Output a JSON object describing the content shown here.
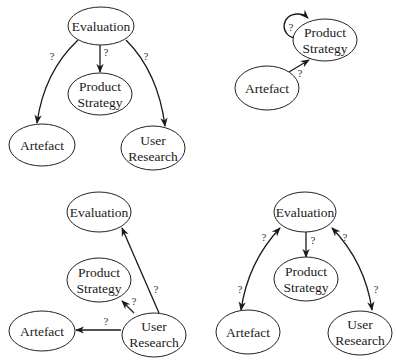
{
  "edge_label": "?",
  "colors": {
    "stroke": "#1a1a1a",
    "text": "#1a1a1a",
    "background": "#ffffff"
  },
  "diagrams": [
    {
      "id": "top-left",
      "nodes": [
        {
          "id": "evaluation",
          "lines": [
            "Evaluation"
          ]
        },
        {
          "id": "product-strategy",
          "lines": [
            "Product",
            "Strategy"
          ]
        },
        {
          "id": "artefact",
          "lines": [
            "Artefact"
          ]
        },
        {
          "id": "user-research",
          "lines": [
            "User",
            "Research"
          ]
        }
      ],
      "edges": [
        {
          "from": "Evaluation",
          "to": "Artefact",
          "label": "?",
          "direction": "forward"
        },
        {
          "from": "Evaluation",
          "to": "Product Strategy",
          "label": "?",
          "direction": "forward"
        },
        {
          "from": "Evaluation",
          "to": "User Research",
          "label": "?",
          "direction": "forward"
        }
      ]
    },
    {
      "id": "top-right",
      "nodes": [
        {
          "id": "product-strategy",
          "lines": [
            "Product",
            "Strategy"
          ]
        },
        {
          "id": "artefact",
          "lines": [
            "Artefact"
          ]
        }
      ],
      "edges": [
        {
          "from": "Product Strategy",
          "to": "Product Strategy",
          "label": "?",
          "direction": "self-loop"
        },
        {
          "from": "Artefact",
          "to": "Product Strategy",
          "label": "?",
          "direction": "forward"
        }
      ]
    },
    {
      "id": "bottom-left",
      "nodes": [
        {
          "id": "evaluation",
          "lines": [
            "Evaluation"
          ]
        },
        {
          "id": "product-strategy",
          "lines": [
            "Product",
            "Strategy"
          ]
        },
        {
          "id": "artefact",
          "lines": [
            "Artefact"
          ]
        },
        {
          "id": "user-research",
          "lines": [
            "User",
            "Research"
          ]
        }
      ],
      "edges": [
        {
          "from": "User Research",
          "to": "Evaluation",
          "label": "?",
          "direction": "forward"
        },
        {
          "from": "User Research",
          "to": "Product Strategy",
          "label": "?",
          "direction": "forward"
        },
        {
          "from": "User Research",
          "to": "Artefact",
          "label": "?",
          "direction": "forward"
        }
      ]
    },
    {
      "id": "bottom-right",
      "nodes": [
        {
          "id": "evaluation",
          "lines": [
            "Evaluation"
          ]
        },
        {
          "id": "product-strategy",
          "lines": [
            "Product",
            "Strategy"
          ]
        },
        {
          "id": "artefact",
          "lines": [
            "Artefact"
          ]
        },
        {
          "id": "user-research",
          "lines": [
            "User",
            "Research"
          ]
        }
      ],
      "edges": [
        {
          "from": "Evaluation",
          "to": "Artefact",
          "label": "? / ?",
          "direction": "bidirectional"
        },
        {
          "from": "Evaluation",
          "to": "Product Strategy",
          "label": "?",
          "direction": "forward"
        },
        {
          "from": "Evaluation",
          "to": "User Research",
          "label": "? / ?",
          "direction": "bidirectional"
        }
      ]
    }
  ]
}
